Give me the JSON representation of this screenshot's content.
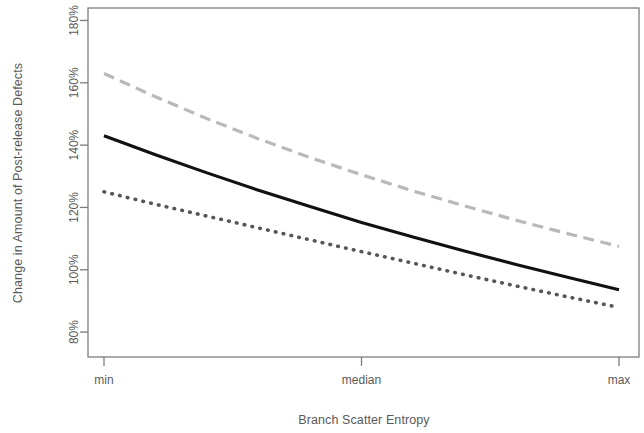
{
  "chart_data": {
    "type": "line",
    "title": "",
    "subtitle": "",
    "xlabel": "Branch Scatter Entropy",
    "ylabel": "Change in Amount of Post-release Defects",
    "x": [
      0,
      0.1,
      0.2,
      0.3,
      0.4,
      0.5,
      0.6,
      0.7,
      0.8,
      0.9,
      1
    ],
    "x_tick_positions": [
      0,
      0.5,
      1
    ],
    "x_tick_labels": [
      "min",
      "median",
      "max"
    ],
    "y_tick_labels": [
      "80%",
      "100%",
      "120%",
      "140%",
      "160%",
      "180%"
    ],
    "y_tick_values": [
      80,
      100,
      120,
      140,
      160,
      180
    ],
    "ylim": [
      72,
      184
    ],
    "xlim": [
      0,
      1
    ],
    "grid": false,
    "legend": "none",
    "series": [
      {
        "name": "upper-bound",
        "style": "dashed",
        "color": "#b9b9b9",
        "values": [
          163.0,
          155.5,
          148.5,
          142.0,
          136.0,
          130.5,
          125.3,
          120.5,
          115.9,
          111.6,
          107.5
        ]
      },
      {
        "name": "estimate",
        "style": "solid",
        "color": "#111111",
        "values": [
          143.0,
          136.9,
          131.1,
          125.5,
          120.3,
          115.2,
          110.5,
          106.0,
          101.7,
          97.6,
          93.6
        ]
      },
      {
        "name": "lower-bound",
        "style": "dotted",
        "color": "#55555c",
        "values": [
          125.0,
          121.0,
          117.2,
          113.4,
          109.6,
          105.8,
          102.1,
          98.4,
          94.8,
          91.3,
          87.9
        ]
      }
    ]
  },
  "axes": {
    "y_title": "Change in Amount of Post-release Defects",
    "x_title": "Branch Scatter Entropy",
    "y_ticks": [
      {
        "label": "180%",
        "value": 180
      },
      {
        "label": "160%",
        "value": 160
      },
      {
        "label": "140%",
        "value": 140
      },
      {
        "label": "120%",
        "value": 120
      },
      {
        "label": "100%",
        "value": 100
      },
      {
        "label": "80%",
        "value": 80
      }
    ],
    "x_ticks": [
      {
        "label": "min",
        "value": 0
      },
      {
        "label": "median",
        "value": 0.5
      },
      {
        "label": "max",
        "value": 1
      }
    ]
  },
  "colors": {
    "frame": "#7d7d7d",
    "text": "#5a5a5a",
    "series_solid": "#111111",
    "series_dashed": "#b9b9b9",
    "series_dotted": "#55555c",
    "background": "#ffffff"
  }
}
